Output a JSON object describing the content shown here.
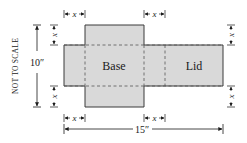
{
  "diagram": {
    "title": "",
    "note": "NOT TO SCALE",
    "colors": {
      "fill": "#d9d9d9",
      "stroke": "#3a3a3a",
      "dash": "#555555",
      "dim": "#1a1a1a",
      "background": "#ffffff"
    },
    "regions": {
      "base": {
        "label": "Base"
      },
      "lid": {
        "label": "Lid"
      }
    },
    "dimensions": {
      "height": {
        "label": "10″",
        "value": 10,
        "unit": "in"
      },
      "width": {
        "label": "15″",
        "value": 15,
        "unit": "in"
      },
      "cut": {
        "label": "x"
      }
    },
    "x_markers": {
      "top_left": "x",
      "top_right": "x",
      "left_top": "x",
      "left_bottom": "x",
      "right_top": "x",
      "right_bottom": "x",
      "bottom_left": "x",
      "bottom_right": "x"
    }
  }
}
